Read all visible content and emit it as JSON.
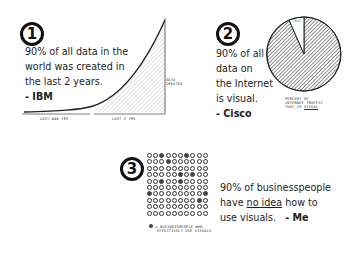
{
  "panel1": {
    "number": "1",
    "statement": [
      "90% of all data in the",
      "world was created in",
      "the last 2 years."
    ],
    "source": "- IBM",
    "chart_labels": {
      "left_span": "LAST ### YRS",
      "right_span": "LAST 2 YRS",
      "y_label": [
        "DATA",
        "CREATED"
      ]
    }
  },
  "panel2": {
    "number": "2",
    "statement": [
      "90% of all",
      "data on",
      "the Internet",
      "is visual."
    ],
    "source": "- Cisco",
    "slice_label": "TEXT",
    "caption": [
      "PERCENT OF",
      "INTERNET TRAFFIC",
      "THAT IS"
    ],
    "caption_emph": "VISUAL"
  },
  "panel3": {
    "number": "3",
    "statement_pre": "90% of businesspeople",
    "statement_mid_pre": "have ",
    "statement_emph": "no idea",
    "statement_mid_post": " how to",
    "statement_end": "use visuals.",
    "source": "- Me",
    "legend": [
      "= BUSINESSPEOPLE WHO",
      "EFFECTIVELY USE VISUALS"
    ]
  },
  "chart_data": [
    {
      "type": "area",
      "title": "90% of all data in the world was created in the last 2 years.",
      "xlabel": "time",
      "ylabel": "DATA CREATED",
      "x_segments": [
        "LAST ### YRS",
        "LAST 2 YRS"
      ],
      "x": [
        0,
        0.2,
        0.4,
        0.55,
        0.7,
        0.85,
        1.0
      ],
      "values": [
        0.01,
        0.02,
        0.04,
        0.12,
        0.35,
        0.65,
        1.0
      ],
      "shaded_region": "LAST 2 YRS"
    },
    {
      "type": "pie",
      "title": "PERCENT OF INTERNET TRAFFIC THAT IS VISUAL",
      "categories": [
        "Visual",
        "TEXT"
      ],
      "values": [
        90,
        10
      ]
    },
    {
      "type": "table",
      "title": "Businesspeople who effectively use visuals",
      "grid": [
        10,
        10
      ],
      "filled_count": 10,
      "total": 100,
      "legend": "= BUSINESSPEOPLE WHO EFFECTIVELY USE VISUALS"
    }
  ]
}
